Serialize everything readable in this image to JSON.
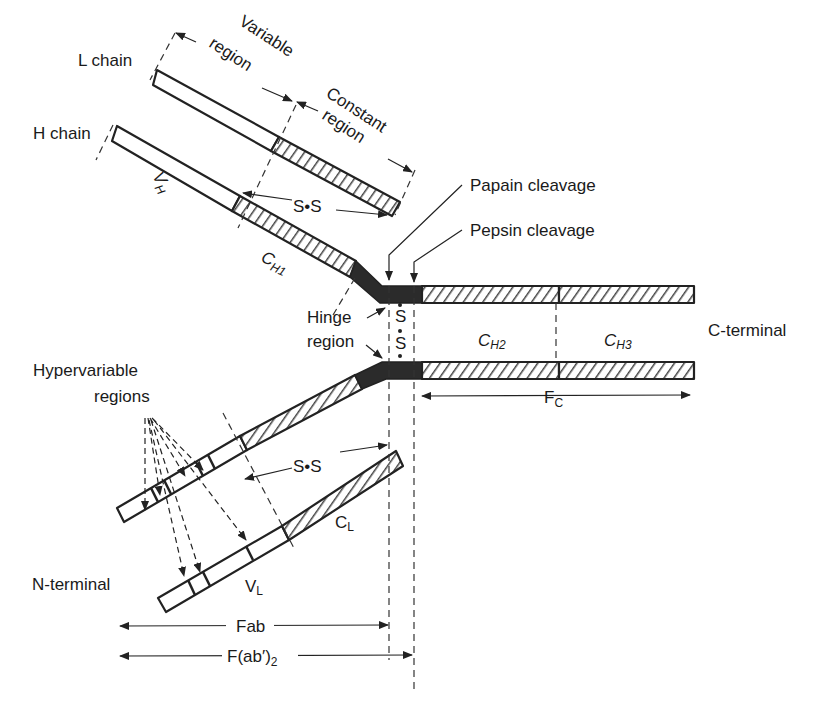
{
  "diagram": {
    "type": "antibody-structure",
    "labels": {
      "l_chain": "L chain",
      "h_chain": "H chain",
      "variable_region_1": "Variable",
      "variable_region_2": "region",
      "constant_region_1": "Constant",
      "constant_region_2": "region",
      "vh_main": "V",
      "vh_sub": "H",
      "ch1_main": "C",
      "ch1_sub": "H1",
      "ss_top": "S•S",
      "ss_bottom": "S•S",
      "papain": "Papain cleavage",
      "pepsin": "Pepsin cleavage",
      "hinge_1": "Hinge",
      "hinge_2": "region",
      "hinge_s1": "S",
      "hinge_s2": "S",
      "ch2_main": "C",
      "ch2_sub": "H2",
      "ch3_main": "C",
      "ch3_sub": "H3",
      "c_terminal": "C-terminal",
      "hypervariable_1": "Hypervariable",
      "hypervariable_2": "regions",
      "fc_main": "F",
      "fc_sub": "C",
      "cl_main": "C",
      "cl_sub": "L",
      "vl_main": "V",
      "vl_sub": "L",
      "n_terminal": "N-terminal",
      "fab": "Fab",
      "fab2_main": "F(ab′)",
      "fab2_sub": "2"
    },
    "colors": {
      "line": "#222222",
      "hinge_fill": "#2b2b2b",
      "background": "#ffffff"
    }
  }
}
